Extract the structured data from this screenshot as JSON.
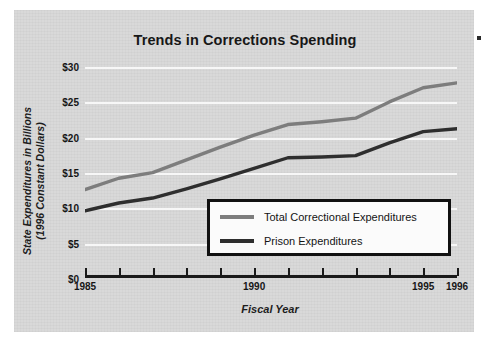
{
  "figure": {
    "background_color": "#d9d9d9",
    "page_color": "#ffffff",
    "corner_mark_label": "scan-artifact-dot"
  },
  "chart_data": {
    "type": "line",
    "title": "Trends in Corrections Spending",
    "xlabel": "Fiscal Year",
    "ylabel": "State Expenditures in Billions (1996 Constant Dollars)",
    "ylabel_line1": "State Expenditures in Billions",
    "ylabel_line2": "(1996 Constant Dollars)",
    "x": [
      1985,
      1986,
      1987,
      1988,
      1989,
      1990,
      1991,
      1992,
      1993,
      1994,
      1995,
      1996
    ],
    "xtick_positions": [
      1985,
      1986,
      1987,
      1988,
      1989,
      1990,
      1991,
      1992,
      1993,
      1994,
      1995,
      1996
    ],
    "xtick_labels": [
      "1985",
      "",
      "",
      "",
      "",
      "1990",
      "",
      "",
      "",
      "",
      "1995",
      "1996"
    ],
    "xlim": [
      1985,
      1996
    ],
    "ylim": [
      0,
      30
    ],
    "ytick_values": [
      0,
      5,
      10,
      15,
      20,
      25,
      30
    ],
    "ytick_labels": [
      "$0",
      "$5",
      "$10",
      "$15",
      "$20",
      "$25",
      "$30"
    ],
    "grid": true,
    "grid_color": "#f7f7f7",
    "legend_position": "lower right",
    "series": [
      {
        "name": "Total Correctional Expenditures",
        "color": "#7d7d7d",
        "values": [
          12.8,
          14.4,
          15.2,
          17.0,
          18.8,
          20.5,
          22.0,
          22.4,
          22.9,
          25.2,
          27.2,
          27.9
        ]
      },
      {
        "name": "Prison Expenditures",
        "color": "#2e2e2e",
        "values": [
          9.8,
          10.9,
          11.6,
          12.9,
          14.3,
          15.8,
          17.3,
          17.4,
          17.6,
          19.4,
          21.0,
          21.4
        ]
      }
    ]
  },
  "legend": {
    "entries": [
      {
        "label": "Total Correctional Expenditures",
        "color": "#7d7d7d"
      },
      {
        "label": "Prison Expenditures",
        "color": "#2e2e2e"
      }
    ]
  }
}
